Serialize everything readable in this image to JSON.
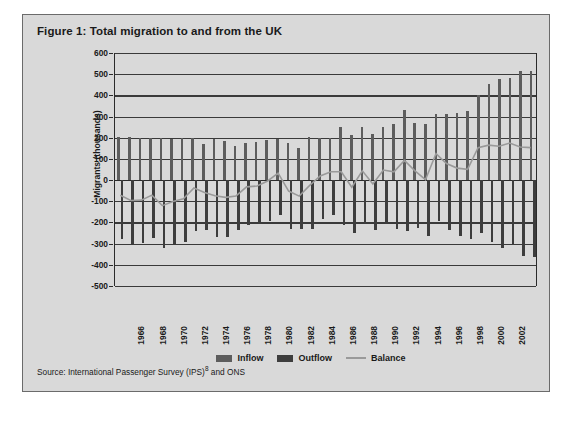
{
  "figure": {
    "title": "Figure 1: Total migration to and from the UK",
    "source": "Source: International Passenger Survey (IPS)",
    "source_sup": "8",
    "source_tail": " and ONS"
  },
  "legend": {
    "inflow_label": "Inflow",
    "outflow_label": "Outflow",
    "balance_label": "Balance"
  },
  "colors": {
    "panel_background": "#d9d9d9",
    "inflow": "#5d5d5d",
    "outflow": "#3d3d3d",
    "balance": "#9a9a9a",
    "axis": "#2b2b2b",
    "gridline": "#3a3a3a",
    "frame_border": "#6b6b6b",
    "text": "#1a1a1a"
  },
  "chart_data": {
    "type": "bar",
    "title": "Figure 1: Total migration to and from the UK",
    "xlabel": "",
    "ylabel": "Migrants (thousands)",
    "ylim": [
      -500,
      600
    ],
    "ytick_step": 100,
    "yticks": [
      600,
      500,
      400,
      300,
      200,
      100,
      0,
      -100,
      -200,
      -300,
      -400,
      -500
    ],
    "grid": true,
    "legend_position": "bottom",
    "x": [
      1964,
      1965,
      1966,
      1967,
      1968,
      1969,
      1970,
      1971,
      1972,
      1973,
      1974,
      1975,
      1976,
      1977,
      1978,
      1979,
      1980,
      1981,
      1982,
      1983,
      1984,
      1985,
      1986,
      1987,
      1988,
      1989,
      1990,
      1991,
      1992,
      1993,
      1994,
      1995,
      1996,
      1997,
      1998,
      1999,
      2000,
      2001,
      2002,
      2003
    ],
    "xtick_labels": [
      "1966",
      "1968",
      "1970",
      "1972",
      "1974",
      "1976",
      "1978",
      "1980",
      "1982",
      "1984",
      "1986",
      "1988",
      "1990",
      "1992",
      "1994",
      "1996",
      "1998",
      "2000",
      "2002"
    ],
    "series": [
      {
        "name": "Inflow",
        "type": "bar",
        "values": [
          205,
          202,
          200,
          200,
          197,
          196,
          199,
          200,
          172,
          192,
          184,
          160,
          175,
          178,
          187,
          195,
          174,
          153,
          202,
          201,
          201,
          250,
          213,
          250,
          216,
          250,
          267,
          329,
          268,
          265,
          314,
          312,
          318,
          327,
          402,
          454,
          479,
          481,
          513,
          513
        ]
      },
      {
        "name": "Outflow",
        "type": "bar",
        "values": [
          -280,
          -302,
          -298,
          -274,
          -321,
          -300,
          -291,
          -240,
          -234,
          -269,
          -269,
          -238,
          -210,
          -209,
          -194,
          -165,
          -229,
          -232,
          -230,
          -184,
          -164,
          -213,
          -250,
          -209,
          -237,
          -205,
          -231,
          -239,
          -227,
          -266,
          -191,
          -236,
          -264,
          -279,
          -251,
          -291,
          -321,
          -308,
          -359,
          -362
        ]
      },
      {
        "name": "Balance",
        "type": "line",
        "values": [
          -75,
          -100,
          -98,
          -74,
          -124,
          -104,
          -92,
          -40,
          -62,
          -77,
          -85,
          -78,
          -35,
          -31,
          -7,
          30,
          -55,
          -79,
          -28,
          17,
          37,
          37,
          -37,
          41,
          -21,
          45,
          36,
          90,
          41,
          -1,
          123,
          76,
          54,
          48,
          151,
          163,
          158,
          173,
          154,
          151
        ]
      }
    ]
  }
}
